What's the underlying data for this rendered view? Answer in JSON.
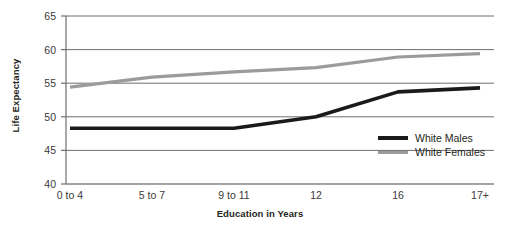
{
  "chart_data": {
    "type": "line",
    "title": "",
    "xlabel": "Education in Years",
    "ylabel": "Life Expectancy",
    "categories": [
      "0 to 4",
      "5 to 7",
      "9 to 11",
      "12",
      "16",
      "17+"
    ],
    "ylim": [
      40,
      65
    ],
    "yticks": [
      40,
      45,
      50,
      55,
      60,
      65
    ],
    "grid": true,
    "legend_position": "inside-right",
    "series": [
      {
        "name": "White Males",
        "color": "#1a1a1a",
        "values": [
          48.3,
          48.3,
          48.3,
          50.0,
          53.7,
          54.3
        ]
      },
      {
        "name": "White Females",
        "color": "#9b9b9b",
        "values": [
          54.4,
          55.9,
          56.7,
          57.3,
          58.9,
          59.4
        ]
      }
    ]
  },
  "axes": {
    "y_title": "Life Expectancy",
    "x_title": "Education in Years",
    "y_tick_labels": [
      "65",
      "60",
      "55",
      "50",
      "45",
      "40"
    ],
    "x_tick_labels": [
      "0 to 4",
      "5 to 7",
      "9 to 11",
      "12",
      "16",
      "17+"
    ]
  },
  "legend": {
    "entries": [
      {
        "label": "White Males",
        "color": "#1a1a1a"
      },
      {
        "label": "White Females",
        "color": "#9b9b9b"
      }
    ]
  }
}
